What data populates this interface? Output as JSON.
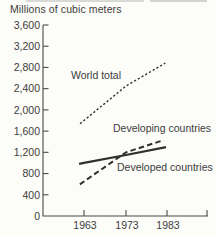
{
  "figure": {
    "title": "Millions of cubic meters"
  },
  "colors": {
    "background": "#fcfcf8",
    "text_ink": "#3d3d3d",
    "line_ink": "#2f2f2f",
    "axis_ink": "#4a4a4a"
  },
  "chart_data": {
    "type": "line",
    "title": "Millions of cubic meters",
    "x": [
      1963,
      1973,
      1983
    ],
    "xtick_labels": [
      "1963",
      "1973",
      "1983"
    ],
    "ylim": [
      0,
      3600
    ],
    "ytick_step": 400,
    "ytick_labels": [
      "0",
      "400",
      "800",
      "1,200",
      "1,600",
      "2,000",
      "2,400",
      "2,800",
      "3,200",
      "3,600"
    ],
    "grid": false,
    "legend_position": "inline-annotations",
    "series": [
      {
        "name": "World total",
        "values": [
          1800,
          2450,
          2900
        ],
        "line_style": "dotted"
      },
      {
        "name": "Developing countries",
        "values": [
          650,
          1200,
          1450
        ],
        "line_style": "dashed"
      },
      {
        "name": "Developed countries",
        "values": [
          1000,
          1150,
          1300
        ],
        "line_style": "solid"
      }
    ],
    "annotations": [
      {
        "text": "World total"
      },
      {
        "text": "Developing countries"
      },
      {
        "text": "Developed countries"
      }
    ]
  }
}
